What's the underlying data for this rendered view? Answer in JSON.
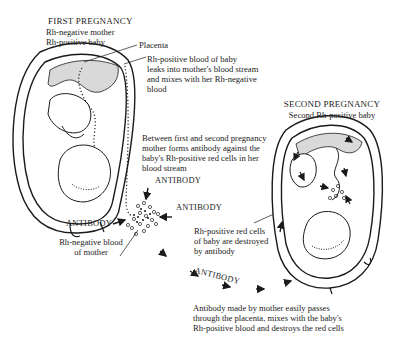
{
  "first_pregnancy": {
    "title": "FIRST PREGNANCY",
    "subtitle_1": "Rh-negative mother",
    "subtitle_2": "Rh-positive baby"
  },
  "labels": {
    "placenta": "Placenta",
    "leak_1": "Rh-positive blood of baby",
    "leak_2": "leaks into mother's blood stream",
    "leak_3": "and mixes with her Rh-negative",
    "leak_4": "blood",
    "between_1": "Between first and second pregnancy",
    "between_2": "mother forms antibody against the",
    "between_3": "baby's Rh-positive red cells in her",
    "between_4": "blood stream",
    "antibody_top": "ANTIBODY",
    "antibody_right": "ANTIBODY",
    "antibody_left": "ANTIBODY",
    "rh_neg_1": "Rh-negative blood",
    "rh_neg_2": "of mother",
    "destroyed_1": "Rh-positive red cells",
    "destroyed_2": "of baby are destroyed",
    "destroyed_3": "by antibody",
    "antibody_diag": "ANTIBODY",
    "passes_1": "Antibody made by mother easily passes",
    "passes_2": "through the placenta, mixes with the baby's",
    "passes_3": "Rh-positive blood and destroys the red cells"
  },
  "second_pregnancy": {
    "title": "SECOND PREGNANCY",
    "subtitle": "Second Rh-positive baby"
  },
  "colors": {
    "ink": "#1a1a1a",
    "placenta_fill": "#d9d9d9",
    "background": "#ffffff"
  }
}
